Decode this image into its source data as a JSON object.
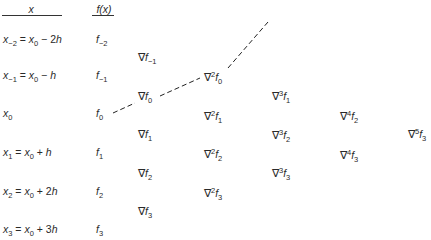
{
  "headers": {
    "x": "x",
    "fx": "f(x)"
  },
  "rows": [
    {
      "x_sub": "−2",
      "x_rhs": "= x",
      "x_rhs_sub": "0",
      "x_tail": " − 2h",
      "f_sub": "−2"
    },
    {
      "x_sub": "−1",
      "x_rhs": "= x",
      "x_rhs_sub": "0",
      "x_tail": " − h",
      "f_sub": "−1"
    },
    {
      "x_sub": "0",
      "x_rhs": "",
      "x_rhs_sub": "",
      "x_tail": "",
      "f_sub": "0"
    },
    {
      "x_sub": "1",
      "x_rhs": "= x",
      "x_rhs_sub": "0",
      "x_tail": " + h",
      "f_sub": "1"
    },
    {
      "x_sub": "2",
      "x_rhs": "= x",
      "x_rhs_sub": "0",
      "x_tail": " + 2h",
      "f_sub": "2"
    },
    {
      "x_sub": "3",
      "x_rhs": "= x",
      "x_rhs_sub": "0",
      "x_tail": " + 3h",
      "f_sub": "3"
    }
  ],
  "symbols": {
    "nabla": "∇",
    "x": "x",
    "f": "f"
  },
  "differences": {
    "d1": [
      {
        "order": "",
        "sub": "−1"
      },
      {
        "order": "",
        "sub": "0"
      },
      {
        "order": "",
        "sub": "1"
      },
      {
        "order": "",
        "sub": "2"
      },
      {
        "order": "",
        "sub": "3"
      }
    ],
    "d2": [
      {
        "order": "2",
        "sub": "0"
      },
      {
        "order": "2",
        "sub": "1"
      },
      {
        "order": "2",
        "sub": "2"
      },
      {
        "order": "2",
        "sub": "3"
      }
    ],
    "d3": [
      {
        "order": "3",
        "sub": "1"
      },
      {
        "order": "3",
        "sub": "2"
      },
      {
        "order": "3",
        "sub": "3"
      }
    ],
    "d4": [
      {
        "order": "4",
        "sub": "2"
      },
      {
        "order": "4",
        "sub": "3"
      }
    ],
    "d5": [
      {
        "order": "5",
        "sub": "3"
      }
    ]
  }
}
